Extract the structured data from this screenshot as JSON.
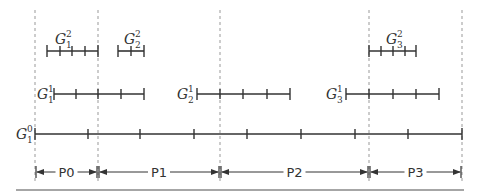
{
  "diagram": {
    "colors": {
      "line": "#333333",
      "dashed": "#999999",
      "rule": "#888888",
      "background": "#ffffff"
    },
    "partition_boundaries_x": [
      35,
      98,
      220,
      369,
      462
    ],
    "levels": [
      {
        "level": 2,
        "y": 51,
        "grids": [
          {
            "name": "G",
            "sub": "1",
            "sup": "2",
            "label_x": 55,
            "label_y": 30,
            "ticks": [
              47,
              60,
              72,
              85,
              98
            ]
          },
          {
            "name": "G",
            "sub": "2",
            "sup": "2",
            "label_x": 124,
            "label_y": 30,
            "ticks": [
              118,
              131,
              144
            ]
          },
          {
            "name": "G",
            "sub": "3",
            "sup": "2",
            "label_x": 386,
            "label_y": 30,
            "ticks": [
              369,
              381,
              393,
              405,
              416
            ]
          }
        ]
      },
      {
        "level": 1,
        "y": 94,
        "grids": [
          {
            "name": "G",
            "sub": "1",
            "sup": "1",
            "label_x": 37,
            "label_y": 94,
            "ticks": [
              54,
              76,
              98,
              121,
              144
            ]
          },
          {
            "name": "G",
            "sub": "2",
            "sup": "1",
            "label_x": 177,
            "label_y": 94,
            "ticks": [
              197,
              220,
              243,
              267,
              290
            ]
          },
          {
            "name": "G",
            "sub": "3",
            "sup": "1",
            "label_x": 326,
            "label_y": 94,
            "ticks": [
              346,
              369,
              393,
              416,
              439
            ]
          }
        ]
      },
      {
        "level": 0,
        "y": 134,
        "grids": [
          {
            "name": "G",
            "sub": "1",
            "sup": "0",
            "label_x": 16,
            "label_y": 134,
            "ticks": [
              35,
              88,
              140,
              194,
              247,
              301,
              355,
              408,
              462
            ]
          }
        ]
      }
    ],
    "partitions": [
      {
        "label": "P0",
        "x0": 35,
        "x1": 98
      },
      {
        "label": "P1",
        "x0": 98,
        "x1": 220
      },
      {
        "label": "P2",
        "x0": 220,
        "x1": 369
      },
      {
        "label": "P3",
        "x0": 369,
        "x1": 462
      }
    ],
    "partition_arrow_y": 172,
    "bottom_rule": {
      "x0": 16,
      "x1": 464,
      "y": 190
    }
  }
}
